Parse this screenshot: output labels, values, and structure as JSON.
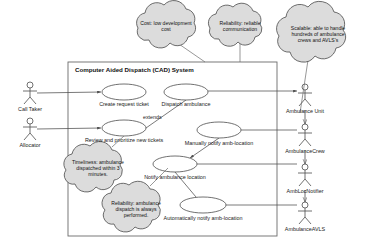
{
  "diagram": {
    "type": "uml-use-case-diagram",
    "system_boundary": {
      "title": "Computer Aided Dispatch (CAD) System",
      "x": 68,
      "y": 62,
      "w": 209,
      "h": 174
    },
    "actors_left": [
      {
        "name": "Call Taker",
        "x": 30,
        "y": 85
      },
      {
        "name": "Allocator",
        "x": 30,
        "y": 121
      }
    ],
    "actors_right": [
      {
        "name": "Ambulance Unit",
        "x": 305,
        "y": 87
      },
      {
        "name": "AmbulanceCrew",
        "x": 305,
        "y": 127
      },
      {
        "name": "AmbLocNotifier",
        "x": 305,
        "y": 167
      },
      {
        "name": "AmbulanceAVLS",
        "x": 305,
        "y": 205
      }
    ],
    "use_cases": [
      {
        "label": "Create request ticket",
        "cx": 124,
        "cy": 92,
        "rx": 22,
        "ry": 8,
        "label_x": 124,
        "label_y": 101
      },
      {
        "label": "Dispatch ambulance",
        "cx": 186,
        "cy": 92,
        "rx": 22,
        "ry": 8,
        "label_x": 186,
        "label_y": 101
      },
      {
        "label": "Review and prioritize new tickets",
        "cx": 124,
        "cy": 128,
        "rx": 22,
        "ry": 8,
        "label_x": 124,
        "label_y": 137
      },
      {
        "label": "Manually notify amb-location",
        "cx": 219,
        "cy": 130,
        "rx": 22,
        "ry": 8,
        "label_x": 219,
        "label_y": 140
      },
      {
        "label": "Notify ambulance location",
        "cx": 175,
        "cy": 164,
        "rx": 22,
        "ry": 8,
        "label_x": 175,
        "label_y": 174
      },
      {
        "label": "Automatically notify amb-location",
        "cx": 203,
        "cy": 205,
        "rx": 23,
        "ry": 8,
        "label_x": 203,
        "label_y": 215
      }
    ],
    "relationship_labels": [
      {
        "text": "extends",
        "x": 143,
        "y": 117
      }
    ],
    "notes": [
      {
        "id": "cost-note",
        "text": "Cost: low development cost",
        "cx": 166,
        "cy": 26,
        "rx": 39,
        "ry": 19,
        "anchor_x": 205,
        "anchor_y": 62
      },
      {
        "id": "reliability-communication-note",
        "text": "Reliability: reliable communication",
        "cx": 240,
        "cy": 26,
        "rx": 34,
        "ry": 17,
        "anchor_x": 240,
        "anchor_y": 62
      },
      {
        "id": "scalable-note",
        "text": "Scalable: able to handle hundreds of ambulance crews and AVLS's",
        "cx": 318,
        "cy": 34,
        "rx": 42,
        "ry": 27,
        "anchor_x": 305,
        "anchor_y": 110
      },
      {
        "id": "timeliness-note",
        "text": "Timeliness: ambulance dispatched within 3 minutes.",
        "cx": 98,
        "cy": 168,
        "rx": 34,
        "ry": 22,
        "anchor_x": 124,
        "anchor_y": 136
      },
      {
        "id": "reliability-dispatch-note",
        "text": "Reliability: ambulance dispatch is always performed.",
        "cx": 136,
        "cy": 208,
        "rx": 33,
        "ry": 23,
        "anchor_x": 168,
        "anchor_y": 168
      }
    ],
    "colors": {
      "line": "#4d4d4d",
      "note_fill": "#dcdcdc",
      "note_stroke": "#4a4a4a",
      "ellipse_fill": "#ffffff",
      "text": "#111111",
      "background": "#ffffff"
    }
  }
}
